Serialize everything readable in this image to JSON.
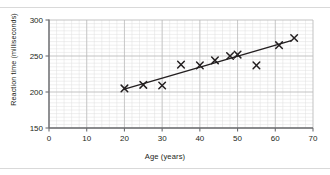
{
  "chart_data": {
    "type": "scatter",
    "title": "",
    "xlabel": "Age (years)",
    "ylabel": "Reaction time (milliseconds)",
    "xlim": [
      0,
      70
    ],
    "ylim": [
      150,
      300
    ],
    "xticks": [
      0,
      10,
      20,
      30,
      40,
      50,
      60,
      70
    ],
    "yticks": [
      150,
      200,
      250,
      300
    ],
    "xtick_labels": [
      "0",
      "10",
      "20",
      "30",
      "40",
      "50",
      "60",
      "70"
    ],
    "ytick_labels": [
      "150",
      "200",
      "250",
      "300"
    ],
    "x_minor_step": 2,
    "y_minor_step": 5,
    "grid": true,
    "grid_minor": true,
    "legend": false,
    "marker": "x",
    "marker_color": "#231f20",
    "grid_major_color": "#b8b8b8",
    "grid_minor_color": "#dedede",
    "axis_color": "#6d6e71",
    "points": [
      {
        "x": 20,
        "y": 205
      },
      {
        "x": 25,
        "y": 210
      },
      {
        "x": 30,
        "y": 209
      },
      {
        "x": 35,
        "y": 238
      },
      {
        "x": 40,
        "y": 237
      },
      {
        "x": 44,
        "y": 244
      },
      {
        "x": 48,
        "y": 250
      },
      {
        "x": 50,
        "y": 252
      },
      {
        "x": 55,
        "y": 237
      },
      {
        "x": 61,
        "y": 265
      },
      {
        "x": 65,
        "y": 275
      }
    ],
    "trendline": {
      "x0": 20,
      "y0": 204,
      "x1": 64,
      "y1": 271,
      "color": "#231f20"
    }
  },
  "axis": {
    "xtick_0": "0",
    "xtick_1": "10",
    "xtick_2": "20",
    "xtick_3": "30",
    "xtick_4": "40",
    "xtick_5": "50",
    "xtick_6": "60",
    "xtick_7": "70",
    "ytick_0": "150",
    "ytick_1": "200",
    "ytick_2": "250",
    "ytick_3": "300"
  }
}
